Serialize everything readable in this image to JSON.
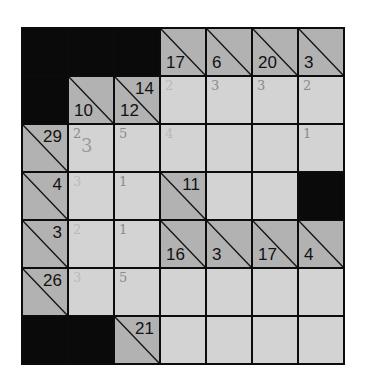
{
  "puzzle": {
    "type": "kakuro",
    "rows": 7,
    "cols": 7,
    "colors": {
      "grid_line": "#0c0c0c",
      "black_cell": "#0a0a0a",
      "white_cell": "#d3d3d3",
      "clue_cell": "#b2b2b2",
      "pencil": "#8a8a8a"
    },
    "clues": {
      "r0c3": {
        "down": "17"
      },
      "r0c4": {
        "down": "6"
      },
      "r0c5": {
        "down": "20"
      },
      "r0c6": {
        "down": "3"
      },
      "r1c1": {
        "down": "10"
      },
      "r1c2": {
        "across": "14",
        "down": "12"
      },
      "r2c0": {
        "across": "29"
      },
      "r3c0": {
        "across": "4"
      },
      "r3c3": {
        "across": "11"
      },
      "r4c0": {
        "across": "3"
      },
      "r4c3": {
        "down": "16"
      },
      "r4c4": {
        "down": "3"
      },
      "r4c5": {
        "down": "17"
      },
      "r4c6": {
        "down": "4"
      },
      "r5c0": {
        "across": "26"
      },
      "r6c2": {
        "across": "21"
      }
    },
    "pencil_marks": {
      "r1c3": "2",
      "r1c4": "3",
      "r1c5": "3",
      "r1c6": "2",
      "r2c1": "2",
      "r2c1_overwrite": "3",
      "r2c2": "5",
      "r2c3": "4",
      "r2c6": "1",
      "r3c1": "3",
      "r3c2": "1",
      "r4c1": "2",
      "r4c2": "1",
      "r5c1": "3",
      "r5c2": "5"
    }
  }
}
